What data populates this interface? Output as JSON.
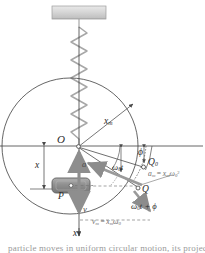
{
  "figure": {
    "caption_partial": "particle moves in uniform circular motion, its projection",
    "colors": {
      "line": "#3f3f3f",
      "arrow_gray": "#8c8c8c",
      "block_fill": "#9a9a9a",
      "block_edge": "#6b6b6b",
      "ceiling_fill": "#d4d4d4",
      "ceiling_edge": "#9c9c9c",
      "spring": "#a7a7a7",
      "text": "#2b2b2b"
    },
    "geometry": {
      "center_x": 70,
      "center_y": 146,
      "radius": 68,
      "angle_phi_deg": 18,
      "angle_omega_t_deg": 26
    }
  },
  "labels": {
    "origin": "O",
    "radius_xm": {
      "base": "x",
      "sub": "m"
    },
    "displacement_x": "x",
    "axis_x_bottom": "x",
    "block_point": "P",
    "point_q0": {
      "base": "Q",
      "sub": "0"
    },
    "point_q": "Q",
    "angle_phi": "ϕ",
    "angle_omega0t": {
      "base": "ω",
      "sub": "0",
      "tail": "t"
    },
    "angle_omega0t_plus_phi": {
      "base": "ω",
      "sub": "0",
      "tail": "t + ϕ"
    },
    "vector_a": "a",
    "vector_v": "v",
    "accel_magnitude": {
      "lhs_base": "a",
      "lhs_sub": "m",
      "eq": "=",
      "rhs_base": "x",
      "rhs_sub": "m",
      "rhs2_base": "ω",
      "rhs2_sub": "0",
      "rhs2_sup": "2"
    },
    "velocity_magnitude": {
      "lhs_base": "v",
      "lhs_sub": "m",
      "eq": "=",
      "rhs_base": "x",
      "rhs_sub": "m",
      "rhs2_base": "ω",
      "rhs2_sub": "0"
    }
  },
  "elements": {
    "ceiling_support": "ceiling-support-bar",
    "spring": "coil-spring",
    "reference_circle": "reference-circle",
    "horizontal_axis": "horizontal-axis",
    "vertical_axis": "vertical-axis",
    "block": "oscillating-block",
    "velocity_arrow": "velocity-vector-arrow",
    "acceleration_arrow": "acceleration-vector-arrow",
    "radius_arrow": "radius-arrow",
    "phase_arc": "phase-angle-arc"
  }
}
